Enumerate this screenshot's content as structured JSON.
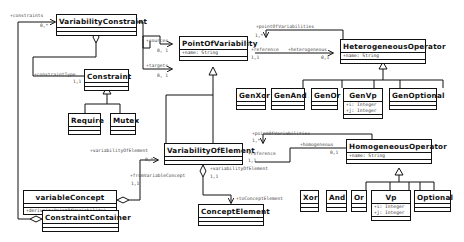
{
  "diagram": {
    "type": "uml-class-diagram",
    "classes": {
      "variability_constraint": {
        "name": "VariabilityConstraint",
        "attributes": [],
        "operations": []
      },
      "constraint": {
        "name": "Constraint",
        "attributes": [],
        "operations": []
      },
      "require": {
        "name": "Require",
        "attributes": [],
        "operations": []
      },
      "mutex": {
        "name": "Mutex",
        "attributes": [],
        "operations": []
      },
      "point_of_variability": {
        "name": "PointOfVariability",
        "attributes": [
          "+name: String"
        ],
        "operations": []
      },
      "heterogeneous_operator": {
        "name": "HeterogeneousOperator",
        "attributes": [
          "+name: String"
        ],
        "operations": []
      },
      "gen_xor": {
        "name": "GenXor",
        "attributes": [],
        "operations": []
      },
      "gen_and": {
        "name": "GenAnd",
        "attributes": [],
        "operations": []
      },
      "gen_or": {
        "name": "GenOr",
        "attributes": [],
        "operations": []
      },
      "gen_vp": {
        "name": "GenVp",
        "attributes": [
          "+i: Integer",
          "+j: Integer"
        ],
        "operations": []
      },
      "gen_optional": {
        "name": "GenOptional",
        "attributes": [],
        "operations": []
      },
      "variability_of_element": {
        "name": "VariabilityOfElement",
        "attributes": [],
        "operations": []
      },
      "homogeneous_operator": {
        "name": "HomogeneousOperator",
        "attributes": [
          "+name: String"
        ],
        "operations": []
      },
      "xor": {
        "name": "Xor",
        "attributes": [],
        "operations": []
      },
      "and": {
        "name": "And",
        "attributes": [],
        "operations": []
      },
      "or": {
        "name": "Or",
        "attributes": [],
        "operations": []
      },
      "vp": {
        "name": "Vp",
        "attributes": [
          "+i: Integer",
          "+j: Integer"
        ],
        "operations": []
      },
      "optional": {
        "name": "Optional",
        "attributes": [],
        "operations": []
      },
      "variable_concept": {
        "name": "variableConcept",
        "attributes": [],
        "operations": [
          "+derive(p:PointOfVariability)"
        ]
      },
      "constraint_container": {
        "name": "ConstraintContainer",
        "attributes": [],
        "operations": []
      },
      "concept_element": {
        "name": "ConceptElement",
        "attributes": [],
        "operations": []
      }
    },
    "labels": {
      "constraints_role": "+constraints",
      "constraints_mult": "0,*",
      "constraint_type_role": "+constraintType",
      "constraint_type_mult": "1,1",
      "sources_role": "+sources",
      "sources_mult": "0, 1",
      "targets_role": "+targets",
      "targets_mult": "0, 1",
      "pov_points_role": "+pointOfVariabilities",
      "pov_points_mult": "1,*",
      "pov_reference_role": "+reference",
      "pov_reference_mult": "1,1",
      "heterogeneous_role": "+heterogeneous",
      "heterogeneous_mult": "0,1",
      "voe_points_role": "+pointOfVariabilities",
      "voe_points_mult": "1,*",
      "voe_reference_role": "+reference",
      "voe_reference_mult": "1,1",
      "homogeneous_role": "+homogeneous",
      "homogeneous_mult": "0,1",
      "voe_role": "+variabilityOfElement",
      "voe_mult": "0,*",
      "from_variable_concept_role": "+fromVariableConcept",
      "from_variable_concept_mult": "1,1",
      "voe_self_role": "+variabilityOfElement",
      "voe_self_mult": "1,1",
      "to_concept_element_role": "+toConceptElement"
    },
    "relationships": [
      {
        "type": "association",
        "from": "ConstraintContainer",
        "to": "VariabilityConstraint",
        "role": "+constraints",
        "multiplicity": "0,*",
        "aggregation": "shared"
      },
      {
        "type": "association",
        "from": "VariabilityConstraint",
        "to": "Constraint",
        "role": "+constraintType",
        "multiplicity": "1,1",
        "aggregation": "shared"
      },
      {
        "type": "generalization",
        "from": "Require",
        "to": "Constraint"
      },
      {
        "type": "generalization",
        "from": "Mutex",
        "to": "Constraint"
      },
      {
        "type": "association",
        "from": "VariabilityConstraint",
        "to": "PointOfVariability",
        "role": "+sources",
        "multiplicity": "0, 1"
      },
      {
        "type": "association",
        "from": "VariabilityConstraint",
        "to": "PointOfVariability",
        "role": "+targets",
        "multiplicity": "0, 1"
      },
      {
        "type": "association",
        "from": "HeterogeneousOperator",
        "to": "PointOfVariability",
        "role": "+pointOfVariabilities",
        "multiplicity": "1,*"
      },
      {
        "type": "association",
        "from": "PointOfVariability",
        "to": "HeterogeneousOperator",
        "role": "+heterogeneous",
        "multiplicity": "0,1"
      },
      {
        "type": "generalization",
        "from": "GenXor",
        "to": "HeterogeneousOperator"
      },
      {
        "type": "generalization",
        "from": "GenAnd",
        "to": "HeterogeneousOperator"
      },
      {
        "type": "generalization",
        "from": "GenOr",
        "to": "HeterogeneousOperator"
      },
      {
        "type": "generalization",
        "from": "GenVp",
        "to": "HeterogeneousOperator"
      },
      {
        "type": "generalization",
        "from": "GenOptional",
        "to": "HeterogeneousOperator"
      },
      {
        "type": "generalization",
        "from": "VariabilityOfElement",
        "to": "PointOfVariability"
      },
      {
        "type": "association",
        "from": "HomogeneousOperator",
        "to": "VariabilityOfElement",
        "role": "+pointOfVariabilities",
        "multiplicity": "1,*"
      },
      {
        "type": "association",
        "from": "VariabilityOfElement",
        "to": "HomogeneousOperator",
        "role": "+homogeneous",
        "multiplicity": "0,1"
      },
      {
        "type": "generalization",
        "from": "Xor",
        "to": "HomogeneousOperator"
      },
      {
        "type": "generalization",
        "from": "And",
        "to": "HomogeneousOperator"
      },
      {
        "type": "generalization",
        "from": "Or",
        "to": "HomogeneousOperator"
      },
      {
        "type": "generalization",
        "from": "Vp",
        "to": "HomogeneousOperator"
      },
      {
        "type": "generalization",
        "from": "Optional",
        "to": "HomogeneousOperator"
      },
      {
        "type": "association",
        "from": "variableConcept",
        "to": "VariabilityOfElement",
        "role": "+variabilityOfElement",
        "multiplicity": "0,*",
        "aggregation": "shared"
      },
      {
        "type": "association",
        "from": "VariabilityOfElement",
        "to": "ConceptElement",
        "role": "+toConceptElement",
        "aggregation": "shared"
      }
    ]
  }
}
